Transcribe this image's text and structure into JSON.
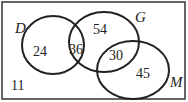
{
  "diagram": {
    "type": "venn",
    "sets": [
      {
        "name": "D",
        "only": "24"
      },
      {
        "name": "G",
        "only": "54"
      },
      {
        "name": "M",
        "only": "45"
      }
    ],
    "regions": {
      "D_only": "24",
      "D_and_G": "36",
      "G_only": "54",
      "G_and_M": "30",
      "M_only": "45",
      "outside": "11"
    },
    "labels": {
      "D": "D",
      "G": "G",
      "M": "M"
    }
  }
}
